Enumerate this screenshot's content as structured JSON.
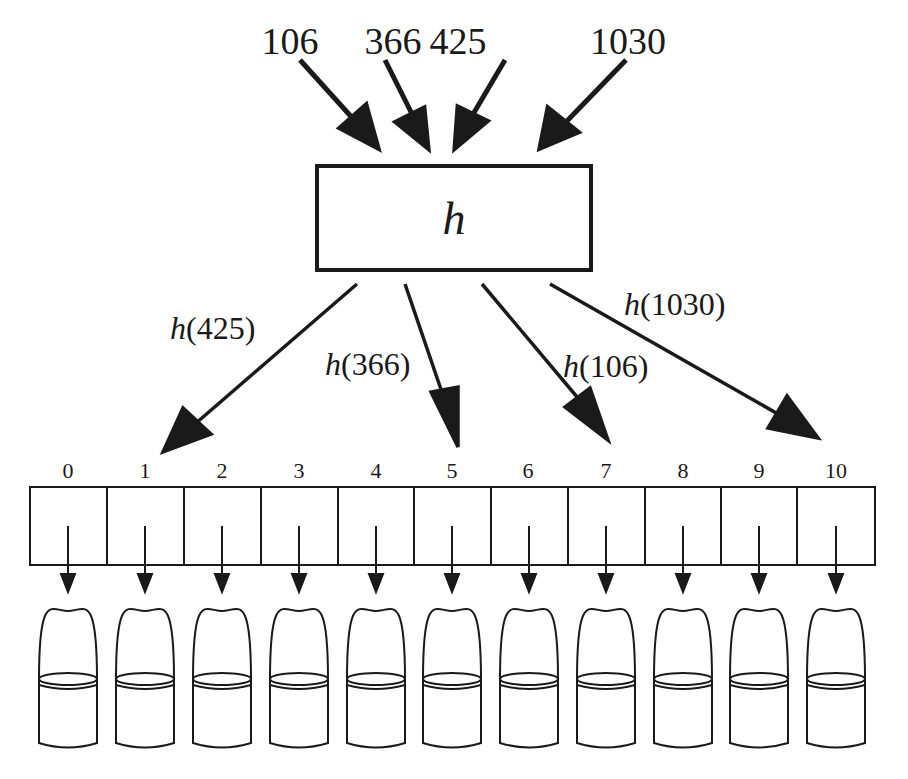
{
  "diagram": {
    "hash_function": {
      "symbol": "h"
    },
    "inputs": [
      {
        "key": "106",
        "x": 290,
        "arrow": [
          [
            300,
            58
          ],
          [
            380,
            148
          ]
        ]
      },
      {
        "key": "366",
        "x": 393,
        "arrow": [
          [
            385,
            60
          ],
          [
            430,
            148
          ]
        ]
      },
      {
        "key": "425",
        "x": 458,
        "arrow": [
          [
            505,
            60
          ],
          [
            455,
            148
          ]
        ]
      },
      {
        "key": "1030",
        "x": 628,
        "arrow": [
          [
            626,
            60
          ],
          [
            540,
            148
          ]
        ]
      }
    ],
    "outputs": [
      {
        "label_fn": "h",
        "label_arg": "(425)",
        "key": "425",
        "target_slot": 1,
        "label_x": 170,
        "label_y": 312,
        "arrow": [
          [
            357,
            283
          ],
          [
            163,
            452
          ]
        ]
      },
      {
        "label_fn": "h",
        "label_arg": "(366)",
        "key": "366",
        "target_slot": 5,
        "label_x": 325,
        "label_y": 348,
        "arrow": [
          [
            405,
            283
          ],
          [
            458,
            447
          ]
        ]
      },
      {
        "label_fn": "h",
        "label_arg": "(106)",
        "key": "106",
        "target_slot": 7,
        "label_x": 563,
        "label_y": 350,
        "arrow": [
          [
            482,
            283
          ],
          [
            608,
            440
          ]
        ]
      },
      {
        "label_fn": "h",
        "label_arg": "(1030)",
        "key": "1030",
        "target_slot": 10,
        "label_x": 624,
        "label_y": 288,
        "arrow": [
          [
            550,
            283
          ],
          [
            818,
            438
          ]
        ]
      }
    ],
    "table": {
      "slots": [
        "0",
        "1",
        "2",
        "3",
        "4",
        "5",
        "6",
        "7",
        "8",
        "9",
        "10"
      ],
      "slot_count": 11
    },
    "colors": {
      "stroke": "#1a1a1a",
      "background": "#ffffff"
    }
  }
}
